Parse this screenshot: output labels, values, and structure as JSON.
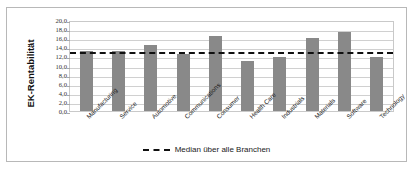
{
  "chart_data": {
    "type": "bar",
    "title": "",
    "xlabel": "",
    "ylabel": "EK-Rentabilität",
    "ylim": [
      0,
      20
    ],
    "ytick_step": 2,
    "ytick_labels": [
      "20,0",
      "18,0",
      "16,0",
      "14,0",
      "12,0",
      "10,0",
      "8,0",
      "6,0",
      "4,0",
      "2,0",
      "0,0"
    ],
    "ytick_values": [
      20,
      18,
      16,
      14,
      12,
      10,
      8,
      6,
      4,
      2,
      0
    ],
    "grid": true,
    "legend_position": "bottom",
    "categories": [
      "Manufacturing",
      "Service",
      "Automotive",
      "Communications",
      "Consumer",
      "Health Care",
      "Industrials",
      "Materials",
      "Software",
      "Technology"
    ],
    "values": [
      13.2,
      13.2,
      14.5,
      12.5,
      16.5,
      11.0,
      11.8,
      16.0,
      17.3,
      11.8
    ],
    "series": [
      {
        "name": "EK-Rentabilität",
        "values": [
          13.2,
          13.2,
          14.5,
          12.5,
          16.5,
          11.0,
          11.8,
          16.0,
          17.3,
          11.8
        ],
        "color": "#898989"
      }
    ],
    "reference_line": {
      "label": "Median über alle Branchen",
      "value": 13.3,
      "style": "dashed",
      "color": "#101010"
    },
    "colors": {
      "bar": "#898989",
      "median_line": "#101010",
      "gridline": "#d0d0d0",
      "plot_border": "#c9c9c9",
      "frame_border": "#b8b8b8",
      "background": "#ffffff",
      "text": "#1a1a1a"
    }
  }
}
